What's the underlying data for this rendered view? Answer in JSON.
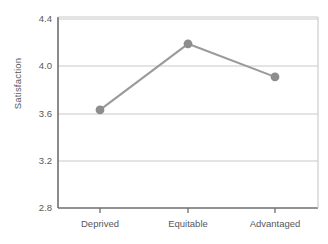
{
  "chart_data": {
    "type": "line",
    "title": "",
    "subtitle": "",
    "xlabel": "",
    "ylabel": "Satisfaction",
    "categories": [
      "Deprived",
      "Equitable",
      "Advantaged"
    ],
    "values": [
      3.63,
      4.19,
      3.91
    ],
    "series": [
      {
        "name": "Satisfaction",
        "values": [
          3.63,
          4.19,
          3.91
        ]
      }
    ],
    "ylim": [
      2.8,
      4.4
    ],
    "yticks": [
      2.8,
      3.2,
      3.6,
      4.0,
      4.4
    ],
    "ytick_labels": [
      "2.8",
      "3.2",
      "3.6",
      "4.0",
      "4.4"
    ],
    "grid": "horizontal",
    "legend": "none",
    "marker": "circle",
    "colors": {
      "line": "#9a9a9a",
      "marker": "#8d8d8d",
      "grid": "#c9c9c9",
      "axis": "#6e6e6e",
      "text": "#58585a"
    }
  },
  "axes": {
    "y_title": "Satisfaction",
    "y_tick_labels": [
      "4.4",
      "4.0",
      "3.6",
      "3.2",
      "2.8"
    ],
    "x_tick_labels": [
      "Deprived",
      "Equitable",
      "Advantaged"
    ]
  }
}
